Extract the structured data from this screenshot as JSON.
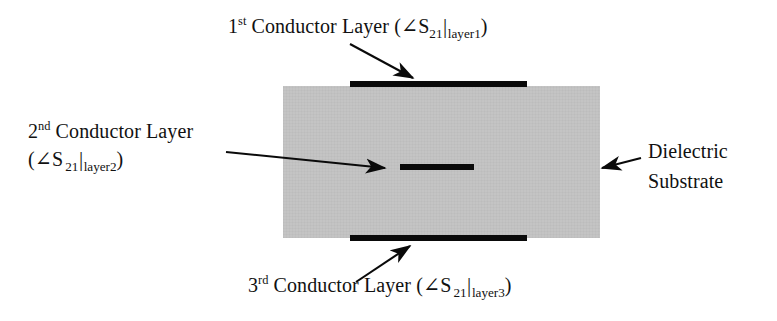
{
  "figure": {
    "type": "cross-section-diagram",
    "colors": {
      "substrate_fill": "#c2c2c2",
      "conductor": "#0a0a0a",
      "background": "#ffffff",
      "text": "#111111"
    }
  },
  "labels": {
    "top": {
      "ordinal_number": "1",
      "ordinal_suffix": "st",
      "name": "Conductor Layer",
      "paren_open": "(",
      "angle_symbol": "∠",
      "s_symbol": "S",
      "s_subscript": "21",
      "vertical_bar": "|",
      "layer_subscript": "layer1",
      "paren_close": ")"
    },
    "left_line1": {
      "ordinal_number": "2",
      "ordinal_suffix": "nd",
      "name": "Conductor Layer"
    },
    "left_line2": {
      "paren_open": "(",
      "angle_symbol": "∠",
      "s_symbol": "S",
      "s_subscript": "21",
      "vertical_bar": "|",
      "layer_subscript": "layer2",
      "paren_close": ")"
    },
    "bottom": {
      "ordinal_number": "3",
      "ordinal_suffix": "rd",
      "name": "Conductor Layer",
      "paren_open": "(",
      "angle_symbol": "∠",
      "s_symbol": "S",
      "s_subscript": "21",
      "vertical_bar": "|",
      "layer_subscript": "layer3",
      "paren_close": ")"
    },
    "right_line1": "Dielectric",
    "right_line2": "Substrate"
  }
}
